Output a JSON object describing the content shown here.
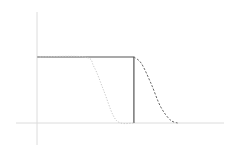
{
  "chart_data": {
    "type": "line",
    "title": "",
    "xlabel": "",
    "ylabel": "",
    "grid": false,
    "legend": null,
    "x_range": [
      0,
      1
    ],
    "y_range": [
      0,
      1
    ],
    "series": [
      {
        "name": "step",
        "style": "solid",
        "color": "#555555",
        "points": [
          [
            0.0,
            1.0
          ],
          [
            0.51,
            1.0
          ],
          [
            0.51,
            0.0
          ]
        ]
      },
      {
        "name": "early-sigmoid",
        "style": "dotted",
        "color": "#c8c8c8",
        "points": [
          [
            0.0,
            1.0
          ],
          [
            0.25,
            1.0
          ],
          [
            0.3,
            0.85
          ],
          [
            0.35,
            0.5
          ],
          [
            0.4,
            0.12
          ],
          [
            0.44,
            0.0
          ],
          [
            0.51,
            0.0
          ]
        ]
      },
      {
        "name": "late-sigmoid",
        "style": "dashed",
        "color": "#666666",
        "points": [
          [
            0.51,
            1.0
          ],
          [
            0.55,
            0.9
          ],
          [
            0.6,
            0.6
          ],
          [
            0.65,
            0.25
          ],
          [
            0.7,
            0.05
          ],
          [
            0.74,
            0.0
          ]
        ]
      }
    ],
    "axes": {
      "color": "#d9d9d9",
      "y_axis_x": 37,
      "x_axis_y": 123
    }
  },
  "plot": {
    "x0_px": 37,
    "x1_px": 223,
    "y_top_px": 57,
    "y_base_px": 123
  }
}
